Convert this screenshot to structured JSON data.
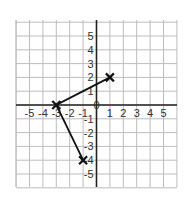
{
  "chart_data": {
    "type": "line",
    "title": "",
    "xlabel": "",
    "ylabel": "",
    "xlim": [
      -6,
      6
    ],
    "ylim": [
      -6,
      6
    ],
    "grid": true,
    "x_tick_labels": [
      "-5",
      "-4",
      "-3",
      "-2",
      "-1",
      "1",
      "2",
      "3",
      "4",
      "5"
    ],
    "y_tick_labels": [
      "5",
      "4",
      "3",
      "2",
      "1",
      "-1",
      "-2",
      "-3",
      "-4",
      "-5"
    ],
    "origin_marker": "0",
    "series": [
      {
        "name": "path",
        "points": [
          [
            1,
            2
          ],
          [
            -3,
            0
          ],
          [
            -1,
            -4
          ]
        ],
        "marker": "x",
        "color": "#111111"
      }
    ]
  },
  "colors": {
    "grid": "#bdbdbd",
    "axes": "#222222",
    "line": "#111111"
  }
}
